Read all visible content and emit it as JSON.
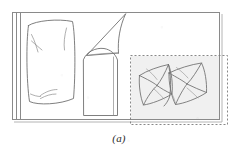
{
  "figure": {
    "caption": "(a)",
    "colors": {
      "background": "#ffffff",
      "ink": "#6e6e6e",
      "ink_dark": "#4a4a4a",
      "frame": "#8a8a8a",
      "dashed_box": "#7a7a7a",
      "inset_fill": "#f0f0f0",
      "caption_text": "#2b2b2b"
    },
    "frame": {
      "name": "outer-bed-frame",
      "x": 12,
      "y": 12,
      "width": 208,
      "height": 108,
      "shadow_offset": 2,
      "inner_rail_x": 20
    },
    "dashed_box": {
      "name": "inset-selection-box",
      "x": 130,
      "y": 55,
      "width": 98,
      "height": 70,
      "dash": "2 2"
    },
    "objects": [
      {
        "name": "left-pillow",
        "type": "pillow",
        "label": "large rectangular pillow with soft creases",
        "bbox": [
          26,
          20,
          50,
          84
        ]
      },
      {
        "name": "center-cushion",
        "type": "cushion",
        "label": "rounded-top folded cushion",
        "bbox": [
          82,
          48,
          36,
          68
        ]
      },
      {
        "name": "sheet-flap",
        "type": "flap",
        "label": "triangular sheet corner folded down from top rail",
        "bbox": [
          86,
          13,
          40,
          45
        ]
      },
      {
        "name": "pillow-cluster",
        "type": "pillow-group",
        "label": "two overlapping crumpled pillows inside inset box",
        "count": 2,
        "bbox": [
          137,
          62,
          74,
          48
        ]
      }
    ]
  }
}
